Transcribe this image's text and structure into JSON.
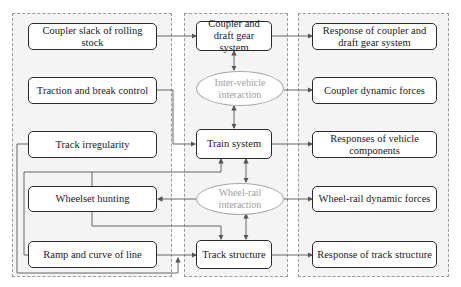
{
  "diagram": {
    "groups": [
      {
        "id": "inputs",
        "label": "Input factors"
      },
      {
        "id": "systems",
        "label": "Train-track system"
      },
      {
        "id": "outputs",
        "label": "Responses"
      }
    ],
    "inputs": [
      {
        "id": "coupler_slack",
        "label": "Coupler slack of rolling stock"
      },
      {
        "id": "traction",
        "label": "Traction and break control"
      },
      {
        "id": "track_irregularity",
        "label": "Track irregularity"
      },
      {
        "id": "wheelset_hunting",
        "label": "Wheelset hunting"
      },
      {
        "id": "ramp_curve",
        "label": "Ramp and curve of line"
      }
    ],
    "systems": [
      {
        "id": "coupler_system",
        "label": "Coupler and draft gear system"
      },
      {
        "id": "train_system",
        "label": "Train system"
      },
      {
        "id": "track_structure",
        "label": "Track structure"
      }
    ],
    "interactions": [
      {
        "id": "inter_vehicle",
        "label": "Inter-vehicle interaction"
      },
      {
        "id": "wheel_rail",
        "label": "Wheel-rail interaction"
      }
    ],
    "outputs": [
      {
        "id": "resp_coupler",
        "label": "Response of coupler and draft gear system"
      },
      {
        "id": "coupler_forces",
        "label": "Coupler dynamic forces"
      },
      {
        "id": "resp_vehicle",
        "label": "Responses of vehicle components"
      },
      {
        "id": "wheel_rail_forces",
        "label": "Wheel-rail dynamic forces"
      },
      {
        "id": "resp_track",
        "label": "Response of track structure"
      }
    ],
    "edges": [
      {
        "from": "coupler_slack",
        "to": "coupler_system"
      },
      {
        "from": "traction",
        "to": "train_system"
      },
      {
        "from": "track_irregularity",
        "to": "track_structure"
      },
      {
        "from": "wheelset_hunting",
        "to": "train_system"
      },
      {
        "from": "wheelset_hunting",
        "to": "track_structure"
      },
      {
        "from": "ramp_curve",
        "to": "track_structure"
      },
      {
        "from": "ramp_curve",
        "to": "train_system"
      },
      {
        "from": "coupler_system",
        "to": "inter_vehicle",
        "bidirectional": true
      },
      {
        "from": "inter_vehicle",
        "to": "train_system",
        "bidirectional": true
      },
      {
        "from": "train_system",
        "to": "wheel_rail",
        "bidirectional": true
      },
      {
        "from": "wheel_rail",
        "to": "track_structure",
        "bidirectional": true
      },
      {
        "from": "wheel_rail",
        "to": "wheelset_hunting"
      },
      {
        "from": "coupler_system",
        "to": "resp_coupler"
      },
      {
        "from": "inter_vehicle",
        "to": "coupler_forces"
      },
      {
        "from": "train_system",
        "to": "resp_vehicle"
      },
      {
        "from": "wheel_rail",
        "to": "wheel_rail_forces"
      },
      {
        "from": "track_structure",
        "to": "resp_track"
      }
    ],
    "colors": {
      "box_border": "#2a2a2a",
      "ellipse_border": "#a8a8a8",
      "ellipse_text": "#a0a0a0",
      "group_fill": "#f4f4f4",
      "wire": "#555555"
    }
  }
}
